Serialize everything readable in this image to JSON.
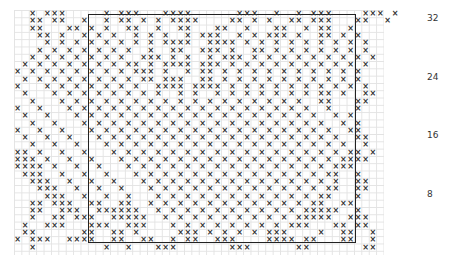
{
  "chart_data": {
    "type": "pattern-grid",
    "title": "",
    "symbol": "×",
    "columns": 50,
    "rows": 33,
    "row_labels": [
      {
        "row": 32,
        "label": "32"
      },
      {
        "row": 24,
        "label": "24"
      },
      {
        "row": 16,
        "label": "16"
      },
      {
        "row": 8,
        "label": "8"
      }
    ],
    "repeat_box": {
      "col_start": 10,
      "col_end": 46,
      "row_start": 1,
      "row_end": 32
    },
    "pattern": [
      "..x.xxx.....x.xxx...xxxx......xxx..x..x.xxx....xxx.x",
      "..xx.xx..x..x.xx.x.x.xxxx....xx.x.x..xx.xxx...xx..x",
      "..xx...xx.x.x..xx..x..xx...xx..x...xx..x.xx..x....",
      "...xx.x..x.x.x..x.x.x..x.xxx..x.x.xxx.x..xx.x.x...",
      "....x.x.x.x.x.x.x.x.xxxx..xxxx.x.x.x.x.x.x.x.x.x..",
      "...x.x.x.x.x.x.x..x..xx..xxx.x..xx.x.x.x.x.x.x.x..",
      "..x.x.x.x.x.x.x..xxx.x.x..x.xxx.x.x.x.x.x.x.x.x.x.",
      ".x.x.x.x.x.x.x.xx.x.xxxx.xxx.x.x.x.x.x.x.x.x.x.x..",
      "x.x.x.x.x.x.x.x.xxx.x..x.xx.x.x.x.x.x.x.x.x.x.x...",
      ".x.x.x.x.x.x.x.x.xx.xxx..xx.x.x.x.x.x.x.x.x.x.x...",
      "x...x.x.x.x.x.x.x..xxxx.xxxx.x.x.x.x.x.x.x.x.x.x..",
      ".x...x.x.x.x.x.x.x.x..x.x..x.x.x.x.x.x.x.xx.x..xx.",
      "..x...x.x.x.x.x.x.x.x.x.x.x.x.x.x.x.x.x..xx...xx..",
      "x..x...x.x.x.x.x.x.x.x.x.x.x.x.x.x.x.x.x..x...x...",
      ".x..x...x.x.x.x.x.x.x.x.x.x.x.x.x.x.x.x.x..x.x....",
      "..x..x...x.x.x.x.x.x.x.x.x.x.x.x.x.x.x.x.x..x.x...",
      "x..x..x...x.x.x.x.x.x.x.x.x.x.x.x.x.x.x.x.x..xx...",
      ".x..x..x...x.x.x.x.x.x.x.x.x.x.x.x.x.x.x.x.x..xx..",
      "..x..x..x...x.x.x.x.x.x.x.x.x.x.x.x.x.x.x.x.x..x..",
      "xx.x..x..x...x.x.x.x.x.x.x.x.x.x.x.x.x.x.x.x.xx.x.",
      "xxx.x..x..x...x.x.x.x.x.x.x.x.x.x.x.x.x.x.x.xxxx..",
      "xxxx.x..x..x...x.x.x.x.x.x.x.x.x.x.x.x.x.x.xxx....",
      ".xxx..x..x..x...x.x.x.x.x.x.x.x.x.x.x.x.x.xx..x...",
      "..xxx..x..x..x...x.x.x.x.x.x.x.x.x.x.x.x.x.x..xx..",
      "...xxx..x..x..x...x.x.x.x.x.x.x.x.x.x.x.x.xx..xx..",
      "....xxx..x..x..x...x.x.x.x.x.x.x.x.x.x.x.xx...x...",
      "..xx.xxx..xx..xx..x.x.x.x.x.x.x.x.x.x.x.xx..xx....",
      "..xx..xxx..xxxxxx..x.x.x.x.x.x.x.x.x.x.xxxxx..x...",
      "..x..xx.xxx..xxxxx..x.x.x.x.x.x.x.x.x.xxxxx..xxx..",
      ".x..xxx...xxx..xxx...x.x.x.x.x.x.x.x.xxx...xx.xx..",
      ".xx......xx..xx.x.....xxx.x.x.x.x.xxx....x..xx..x.",
      "x.xxx..xxxx..xx..xx..x.xx..xxx....xxxx.xx...xx..x.",
      "..x.........x..x...xxx.......xxx......xx.......xx."
    ]
  }
}
